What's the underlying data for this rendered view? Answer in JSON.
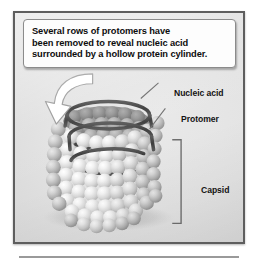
{
  "figure": {
    "name": "helical-virus-cutaway-diagram",
    "background_color": "#ffffff",
    "panel": {
      "fill": "#e3e3e3",
      "border_color": "#5e5e5e"
    }
  },
  "callout": {
    "name": "explanatory-callout",
    "lines": [
      "Several rows of protomers have",
      "been removed to reveal nucleic acid",
      "surrounded by a hollow protein cylinder."
    ],
    "background": "#fdfdfd",
    "border_color": "#8b8b8b",
    "arrow": {
      "name": "curved-pointer-arrow",
      "style": "white curved arrow with gray outline",
      "fill": "#ffffff",
      "stroke": "#8f8f8f",
      "points_to": "cut-away region of capsid"
    }
  },
  "labels": [
    {
      "id": "nucleic-acid",
      "text": "Nucleic acid",
      "leader": true,
      "target": "dark helical strand inside the cylinder"
    },
    {
      "id": "protomer",
      "text": "Protomer",
      "leader": true,
      "target": "individual protein sphere of the capsid"
    },
    {
      "id": "capsid",
      "text": "Capsid",
      "leader": false,
      "bracket": true,
      "target": "full protein cylinder wall"
    }
  ],
  "structure": {
    "name": "helical-virus",
    "capsid": {
      "name": "protein-cylinder",
      "subunit_name": "protomer",
      "subunit_color": "#e4e4e4",
      "subunit_shadow": "#9c9c9c",
      "arrangement": "helical rows of spheres forming a hollow cylinder",
      "rows": 11,
      "columns": 13
    },
    "nucleic_acid": {
      "name": "helical-nucleic-acid-strand",
      "color": "#4a4a4a",
      "turns": 3,
      "shape": "coiled helix within the hollow cylinder"
    }
  },
  "colors": {
    "text": "#0d0d0d",
    "label_text": "#131313",
    "leader_line": "#6e6e6e",
    "bracket": "#6e6e6e",
    "rule": "#9a9a9a"
  }
}
